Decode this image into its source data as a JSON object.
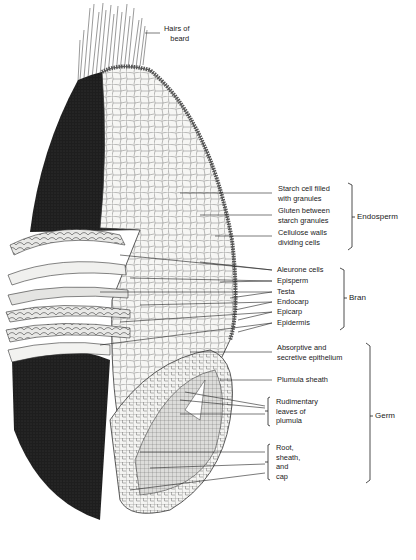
{
  "figure": {
    "labels": {
      "hairs": [
        "Hairs of",
        "beard"
      ],
      "starch": [
        "Starch cell filled",
        "with granules"
      ],
      "gluten": [
        "Gluten between",
        "starch granules"
      ],
      "cellulose": [
        "Cellulose walls",
        "dividing cells"
      ],
      "aleurone": "Aleurone cells",
      "episperm": "Episperm",
      "testa": "Testa",
      "endocarp": "Endocarp",
      "epicarp": "Epicarp",
      "epidermis": "Epidermis",
      "absorptive": [
        "Absorptive and",
        "secretive epithelium"
      ],
      "plumula_sheath": "Plumula sheath",
      "rudimentary": [
        "Rudimentary",
        "leaves of",
        "plumula"
      ],
      "root": [
        "Root,",
        "sheath,",
        "and",
        "cap"
      ]
    },
    "groups": {
      "endosperm": "Endosperm",
      "bran": "Bran",
      "germ": "Germ"
    }
  }
}
